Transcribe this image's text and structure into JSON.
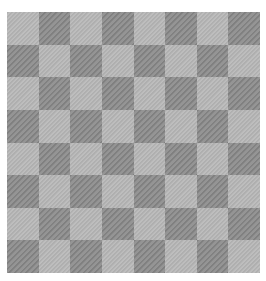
{
  "board": {
    "rows": 8,
    "cols": 8,
    "top_left": "light",
    "colors": {
      "light": "#bababa",
      "dark": "#8e8e8e",
      "background": "#ffffff"
    }
  }
}
